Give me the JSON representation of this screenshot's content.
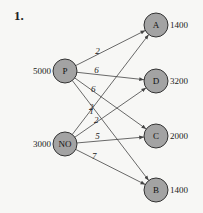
{
  "heading": "1.",
  "sources": [
    {
      "id": "P",
      "label": "P",
      "supply": "5000",
      "cx": 65,
      "cy": 71
    },
    {
      "id": "NO",
      "label": "NO",
      "supply": "3000",
      "cx": 65,
      "cy": 144
    }
  ],
  "destinations": [
    {
      "id": "A",
      "label": "A",
      "demand": "1400",
      "cx": 156,
      "cy": 25
    },
    {
      "id": "D",
      "label": "D",
      "demand": "3200",
      "cx": 156,
      "cy": 81
    },
    {
      "id": "C",
      "label": "C",
      "demand": "2000",
      "cx": 156,
      "cy": 136
    },
    {
      "id": "B",
      "label": "B",
      "demand": "1400",
      "cx": 156,
      "cy": 190
    }
  ],
  "edges": [
    {
      "from": "P",
      "to": "A",
      "cost": "2"
    },
    {
      "from": "P",
      "to": "D",
      "cost": "6"
    },
    {
      "from": "P",
      "to": "C",
      "cost": "6"
    },
    {
      "from": "P",
      "to": "B",
      "cost": "2"
    },
    {
      "from": "NO",
      "to": "A",
      "cost": "1"
    },
    {
      "from": "NO",
      "to": "D",
      "cost": "2"
    },
    {
      "from": "NO",
      "to": "C",
      "cost": "5"
    },
    {
      "from": "NO",
      "to": "B",
      "cost": "7"
    }
  ],
  "colors": {
    "node_fill": "#a3a3a3",
    "node_stroke": "#333333",
    "edge": "#444444",
    "background": "#f7f7f5"
  }
}
